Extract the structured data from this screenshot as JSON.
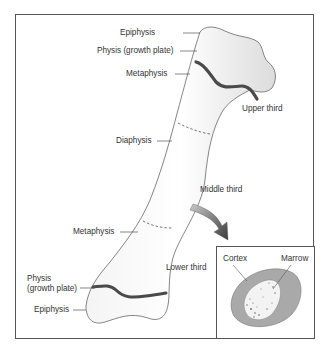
{
  "diagram": {
    "labels": {
      "epiphysis_top": "Epiphysis",
      "physis_top": "Physis (growth plate)",
      "metaphysis_top": "Metaphysis",
      "diaphysis": "Diaphysis",
      "metaphysis_bottom": "Metaphysis",
      "physis_bottom_line1": "Physis",
      "physis_bottom_line2": "(growth plate)",
      "epiphysis_bottom": "Epiphysis",
      "upper_third": "Upper third",
      "middle_third": "Middle third",
      "lower_third": "Lower third"
    },
    "inset": {
      "title": "Cross-section",
      "cortex": "Cortex",
      "marrow": "Marrow"
    },
    "colors": {
      "outline": "#555555",
      "growth_plate": "#4a4a4a",
      "cortex_fill": "#a9a9a9",
      "arrow": "#666666"
    }
  }
}
